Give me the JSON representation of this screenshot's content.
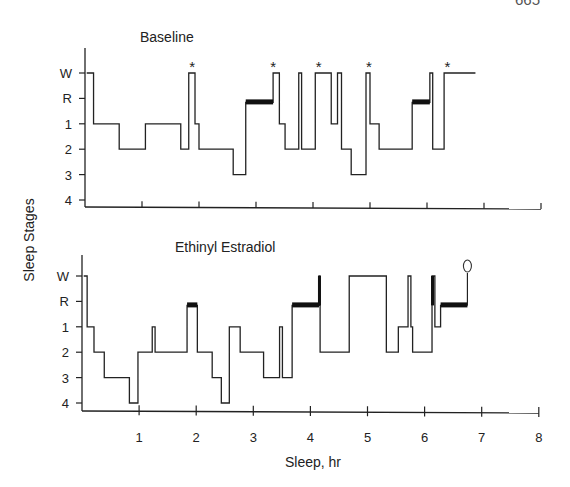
{
  "page_number": "665",
  "shared_ylabel": "Sleep Stages",
  "shared_xlabel": "Sleep, hr",
  "chart_data": [
    {
      "type": "line",
      "subtype": "hypnogram-step",
      "title": "Baseline",
      "xlabel": "Sleep, hr",
      "ylabel": "Sleep Stages",
      "ytick_labels": [
        "W",
        "R",
        "1",
        "2",
        "3",
        "4"
      ],
      "xtick_labels": [
        "",
        "",
        "",
        "",
        "",
        "",
        "",
        ""
      ],
      "xlim": [
        0,
        8
      ],
      "annotations": [
        {
          "symbol": "*",
          "x": 1.88
        },
        {
          "symbol": "*",
          "x": 3.3
        },
        {
          "symbol": "*",
          "x": 4.1
        },
        {
          "symbol": "*",
          "x": 4.98
        },
        {
          "symbol": "*",
          "x": 6.36
        }
      ],
      "steps": [
        {
          "start": 0.03,
          "end": 0.15,
          "stage": "W"
        },
        {
          "start": 0.15,
          "end": 0.6,
          "stage": "1"
        },
        {
          "start": 0.6,
          "end": 1.06,
          "stage": "2"
        },
        {
          "start": 1.06,
          "end": 1.68,
          "stage": "1"
        },
        {
          "start": 1.68,
          "end": 1.82,
          "stage": "2"
        },
        {
          "start": 1.82,
          "end": 1.93,
          "stage": "W"
        },
        {
          "start": 1.93,
          "end": 2.0,
          "stage": "1"
        },
        {
          "start": 2.0,
          "end": 2.6,
          "stage": "2"
        },
        {
          "start": 2.6,
          "end": 2.82,
          "stage": "3"
        },
        {
          "start": 2.82,
          "end": 3.3,
          "stage": "R",
          "rem": true
        },
        {
          "start": 3.3,
          "end": 3.41,
          "stage": "W"
        },
        {
          "start": 3.41,
          "end": 3.51,
          "stage": "1"
        },
        {
          "start": 3.51,
          "end": 3.75,
          "stage": "2"
        },
        {
          "start": 3.75,
          "end": 3.8,
          "stage": "W"
        },
        {
          "start": 3.8,
          "end": 4.04,
          "stage": "2"
        },
        {
          "start": 4.04,
          "end": 4.32,
          "stage": "W"
        },
        {
          "start": 4.32,
          "end": 4.43,
          "stage": "1"
        },
        {
          "start": 4.43,
          "end": 4.5,
          "stage": "W"
        },
        {
          "start": 4.5,
          "end": 4.67,
          "stage": "2"
        },
        {
          "start": 4.67,
          "end": 4.93,
          "stage": "3"
        },
        {
          "start": 4.93,
          "end": 5.0,
          "stage": "W"
        },
        {
          "start": 5.0,
          "end": 5.16,
          "stage": "1"
        },
        {
          "start": 5.16,
          "end": 5.74,
          "stage": "2"
        },
        {
          "start": 5.74,
          "end": 6.05,
          "stage": "R",
          "rem": true
        },
        {
          "start": 6.05,
          "end": 6.1,
          "stage": "W"
        },
        {
          "start": 6.1,
          "end": 6.3,
          "stage": "2"
        },
        {
          "start": 6.3,
          "end": 6.85,
          "stage": "W"
        }
      ]
    },
    {
      "type": "line",
      "subtype": "hypnogram-step",
      "title": "Ethinyl Estradiol",
      "xlabel": "Sleep, hr",
      "ylabel": "Sleep Stages",
      "ytick_labels": [
        "W",
        "R",
        "1",
        "2",
        "3",
        "4"
      ],
      "xtick_labels": [
        "1",
        "2",
        "3",
        "4",
        "5",
        "6",
        "7",
        "8"
      ],
      "xlim": [
        0,
        8
      ],
      "annotations": [
        {
          "symbol": "O",
          "x": 6.75
        }
      ],
      "steps": [
        {
          "start": 0.03,
          "end": 0.09,
          "stage": "W"
        },
        {
          "start": 0.09,
          "end": 0.21,
          "stage": "1"
        },
        {
          "start": 0.21,
          "end": 0.39,
          "stage": "2"
        },
        {
          "start": 0.39,
          "end": 0.83,
          "stage": "3"
        },
        {
          "start": 0.83,
          "end": 0.98,
          "stage": "4"
        },
        {
          "start": 0.98,
          "end": 1.23,
          "stage": "2"
        },
        {
          "start": 1.23,
          "end": 1.28,
          "stage": "1"
        },
        {
          "start": 1.28,
          "end": 1.84,
          "stage": "2"
        },
        {
          "start": 1.84,
          "end": 2.02,
          "stage": "R",
          "rem": true
        },
        {
          "start": 2.02,
          "end": 2.28,
          "stage": "2"
        },
        {
          "start": 2.28,
          "end": 2.44,
          "stage": "3"
        },
        {
          "start": 2.44,
          "end": 2.58,
          "stage": "4"
        },
        {
          "start": 2.58,
          "end": 2.77,
          "stage": "1"
        },
        {
          "start": 2.77,
          "end": 3.18,
          "stage": "2"
        },
        {
          "start": 3.18,
          "end": 3.46,
          "stage": "3"
        },
        {
          "start": 3.46,
          "end": 3.51,
          "stage": "1"
        },
        {
          "start": 3.51,
          "end": 3.68,
          "stage": "3"
        },
        {
          "start": 3.68,
          "end": 4.15,
          "stage": "R",
          "rem": true
        },
        {
          "start": 4.15,
          "end": 4.17,
          "stage": "W",
          "rem": true
        },
        {
          "start": 4.17,
          "end": 4.68,
          "stage": "2"
        },
        {
          "start": 4.68,
          "end": 5.33,
          "stage": "W"
        },
        {
          "start": 5.33,
          "end": 5.54,
          "stage": "2"
        },
        {
          "start": 5.54,
          "end": 5.71,
          "stage": "1"
        },
        {
          "start": 5.71,
          "end": 5.76,
          "stage": "W"
        },
        {
          "start": 5.76,
          "end": 5.79,
          "stage": "1"
        },
        {
          "start": 5.79,
          "end": 6.13,
          "stage": "2"
        },
        {
          "start": 6.13,
          "end": 6.18,
          "stage": "W",
          "rem": true
        },
        {
          "start": 6.18,
          "end": 6.28,
          "stage": "1"
        },
        {
          "start": 6.28,
          "end": 6.75,
          "stage": "R",
          "rem": true
        }
      ]
    }
  ]
}
